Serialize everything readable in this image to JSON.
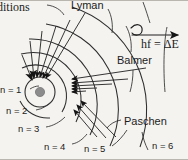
{
  "figure": {
    "title_fragment": "ditions",
    "colors": {
      "background": "#f4f3f0",
      "ink": "#1c1c1c",
      "nucleus_fill": "#8c8c8c",
      "orbit_line": "#3a3a3a"
    }
  },
  "series_labels": {
    "lyman": "Lyman",
    "balmer": "Balmer",
    "paschen": "Paschen"
  },
  "photon": {
    "equation": "hf = ΔE"
  },
  "shells": [
    {
      "label": "n = 1",
      "n": 1
    },
    {
      "label": "n = 2",
      "n": 2
    },
    {
      "label": "n = 3",
      "n": 3
    },
    {
      "label": "n = 4",
      "n": 4
    },
    {
      "label": "n = 5",
      "n": 5
    },
    {
      "label": "n = 6",
      "n": 6
    }
  ],
  "nucleus": {
    "name": "nucleus"
  }
}
